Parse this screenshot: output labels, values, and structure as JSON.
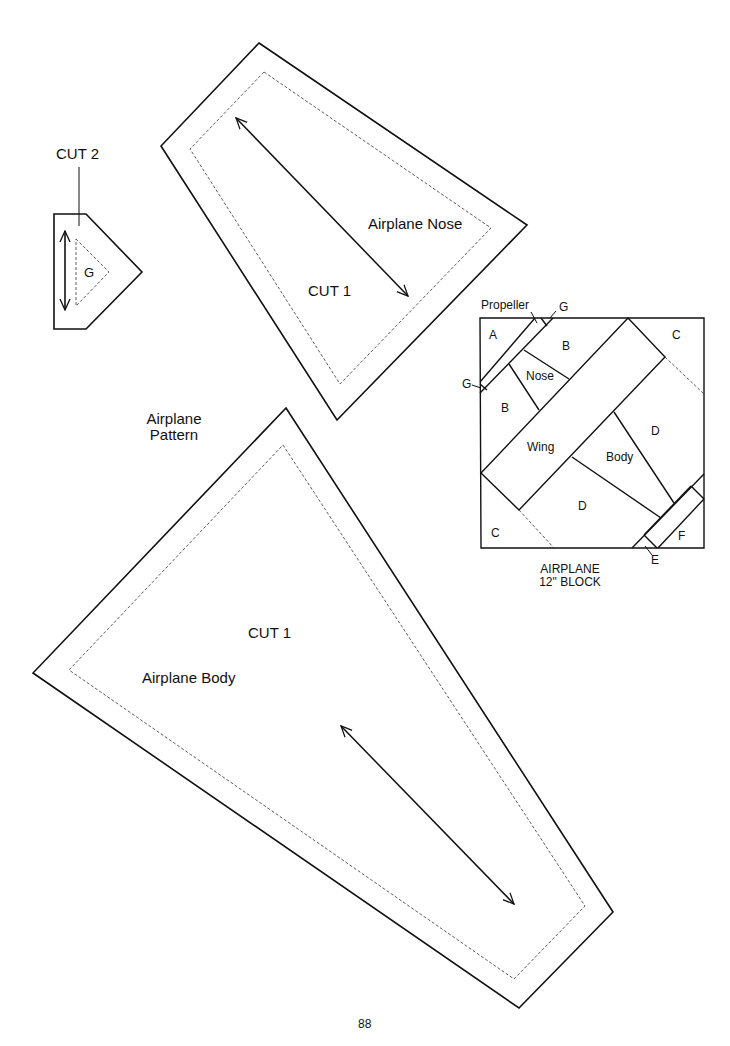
{
  "page": {
    "title": "Airplane Pattern",
    "title_line1": "Airplane",
    "title_line2": "Pattern",
    "page_number": "88"
  },
  "colors": {
    "line": "#111111",
    "background": "#ffffff"
  },
  "pieces": {
    "g_piece": {
      "cut_label": "CUT 2",
      "piece_label": "G"
    },
    "nose": {
      "name_label": "Airplane Nose",
      "cut_label": "CUT 1"
    },
    "body": {
      "name_label": "Airplane Body",
      "cut_label": "CUT 1"
    }
  },
  "block": {
    "caption_line1": "AIRPLANE",
    "caption_line2": "12\" BLOCK",
    "labels": {
      "propeller": "Propeller",
      "g_top": "G",
      "g_left": "G",
      "a": "A",
      "b_top": "B",
      "b_left": "B",
      "c_top": "C",
      "c_bottom": "C",
      "nose": "Nose",
      "wing": "Wing",
      "body": "Body",
      "d_right": "D",
      "d_bottom": "D",
      "e": "E",
      "f": "F"
    }
  }
}
